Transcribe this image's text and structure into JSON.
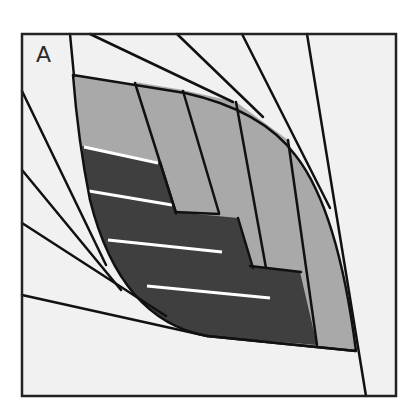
{
  "panel": {
    "label": "A"
  },
  "colors": {
    "background": "#f1f1f1",
    "light_gray": "#a9a9a9",
    "dark_gray": "#3f3f3f",
    "stroke": "#111111",
    "highlight": "#ffffff"
  },
  "figure": {
    "frame": {
      "x": 22,
      "y": 34,
      "width": 374,
      "height": 362
    },
    "light_strip_count": 5,
    "dark_band_count": 4,
    "highlight_line_count": 4,
    "radiating_lines_top": 5,
    "radiating_lines_left": 4
  }
}
